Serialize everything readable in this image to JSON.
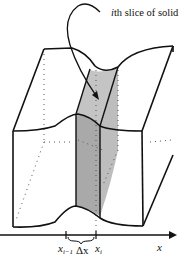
{
  "figure": {
    "annotation": {
      "italic_part": "i",
      "rest": "th slice of solid"
    },
    "axis": {
      "label": "x"
    },
    "ticks": {
      "left": {
        "base": "x",
        "subscript": "i−1"
      },
      "right": {
        "base": "x",
        "subscript": "i"
      }
    },
    "width_label": "Δx",
    "colors": {
      "line": "#111111",
      "slice_front": "#a9a9a9",
      "slice_side": "#c4c4c4",
      "dots": "#555555"
    }
  }
}
